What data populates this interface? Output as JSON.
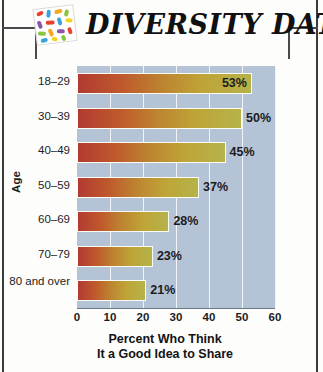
{
  "header": {
    "title": "DIVERSITY DATA",
    "logo_icon": "colored-beads-grid-icon",
    "bracket_left_icon": "corner-bracket-left-icon",
    "bracket_right_icon": "corner-bracket-right-icon"
  },
  "chart_data": {
    "type": "bar",
    "orientation": "horizontal",
    "title": "",
    "xlabel": "Percent Who Think It a Good Idea to Share",
    "xlabel_line1": "Percent Who Think",
    "xlabel_line2": "It a Good Idea to Share",
    "ylabel": "Age",
    "categories": [
      "18–29",
      "30–39",
      "40–49",
      "50–59",
      "60–69",
      "70–79",
      "80 and over"
    ],
    "values": [
      53,
      50,
      45,
      37,
      28,
      23,
      21
    ],
    "data_labels": [
      "53%",
      "50%",
      "45%",
      "37%",
      "28%",
      "23%",
      "21%"
    ],
    "label_placement": [
      "inside",
      "outside",
      "outside",
      "outside",
      "outside",
      "outside",
      "outside"
    ],
    "xlim": [
      0,
      60
    ],
    "xticks": [
      0,
      10,
      20,
      30,
      40,
      50,
      60
    ],
    "xtick_labels": [
      "0",
      "10",
      "20",
      "30",
      "40",
      "50",
      "60"
    ],
    "grid": "vertical",
    "legend": "none",
    "colors": {
      "bar_gradient_start": "#b23a31",
      "bar_gradient_mid": "#bd8330",
      "bar_gradient_end": "#b4b34a",
      "plot_background": "#b4c3d5",
      "gridline": "#f2f5f8",
      "page_background": "#fdfdfc",
      "text": "#1c1c1e",
      "edge_rule": "#3a3a3c"
    }
  }
}
